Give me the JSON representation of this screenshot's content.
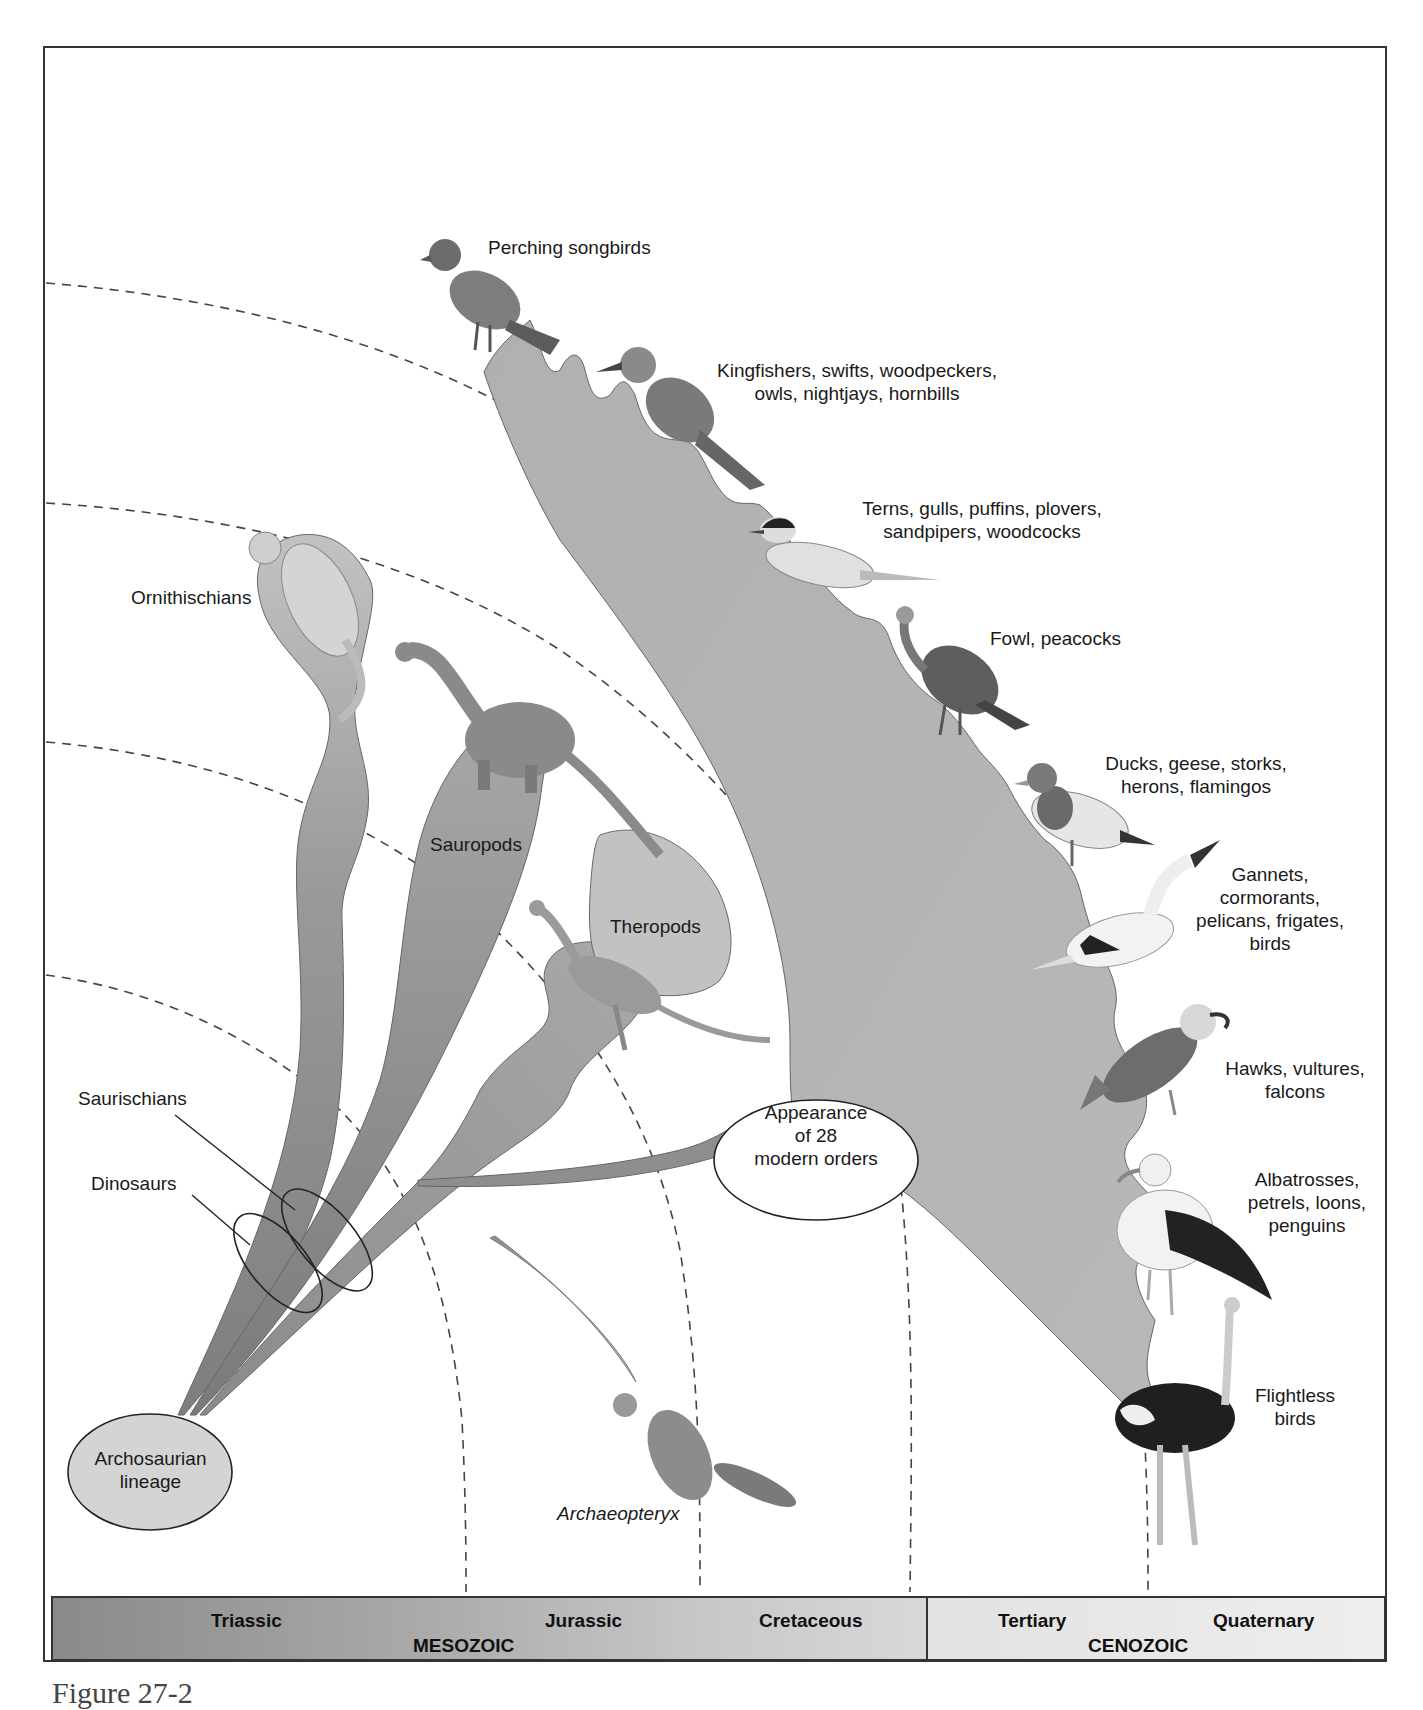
{
  "figure": {
    "caption": "Figure 27-2"
  },
  "labels": {
    "perching_songbirds": "Perching songbirds",
    "kingfishers": [
      "Kingfishers, swifts, woodpeckers,",
      "owls, nightjays, hornbills"
    ],
    "terns": [
      "Terns, gulls, puffins, plovers,",
      "sandpipers, woodcocks"
    ],
    "fowl": "Fowl, peacocks",
    "ducks": [
      "Ducks, geese, storks,",
      "herons, flamingos"
    ],
    "gannets": [
      "Gannets,",
      "cormorants,",
      "pelicans, frigates,",
      "birds"
    ],
    "hawks": [
      "Hawks, vultures,",
      "falcons"
    ],
    "albatrosses": [
      "Albatrosses,",
      "petrels, loons,",
      "penguins"
    ],
    "flightless": [
      "Flightless",
      "birds"
    ],
    "ornithischians": "Ornithischians",
    "sauropods": "Sauropods",
    "theropods": "Theropods",
    "saurischians": "Saurischians",
    "dinosaurs": "Dinosaurs",
    "archosaurian": [
      "Archosaurian",
      "lineage"
    ],
    "appearance": [
      "Appearance",
      "of 28",
      "modern orders"
    ],
    "archaeopteryx": "Archaeopteryx"
  },
  "timescale": {
    "mesozoic": {
      "era": "MESOZOIC",
      "periods": [
        "Triassic",
        "Jurassic",
        "Cretaceous"
      ]
    },
    "cenozoic": {
      "era": "CENOZOIC",
      "periods": [
        "Tertiary",
        "Quaternary"
      ]
    }
  },
  "colors": {
    "branch_dark": "#8c8c8c",
    "branch_mid": "#a6a6a6",
    "branch_light": "#bdbdbd",
    "bird_branch": "#b3b3b3",
    "ellipse_fill": "#d4d4d4",
    "frame": "#333333"
  }
}
